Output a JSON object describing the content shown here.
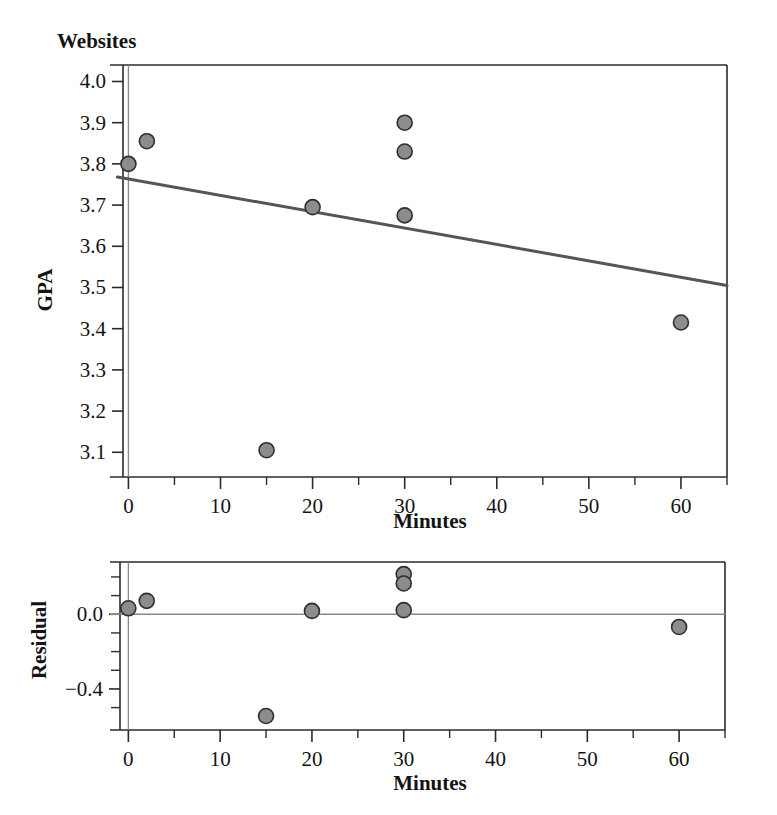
{
  "figure": {
    "title": "Websites",
    "background_color": "#ffffff",
    "point_fill_color": "#8c8c8c",
    "point_stroke_color": "#2e2e2e",
    "fit_line_color": "#555555",
    "axis_color": "#2b2b2b",
    "reference_line_color": "#8a8a8a"
  },
  "chart_data": [
    {
      "id": "scatter-gpa",
      "type": "scatter",
      "title": "Websites",
      "xlabel": "Minutes",
      "ylabel": "GPA",
      "xlim": [
        -2,
        65
      ],
      "ylim": [
        3.04,
        4.04
      ],
      "grid": false,
      "legend": null,
      "x_ticks": [
        0,
        10,
        20,
        30,
        40,
        50,
        60
      ],
      "x_tick_labels": [
        "0",
        "10",
        "20",
        "30",
        "40",
        "50",
        "60"
      ],
      "x_minor_step": 5,
      "y_ticks": [
        3.1,
        3.2,
        3.3,
        3.4,
        3.5,
        3.6,
        3.7,
        3.8,
        3.9,
        4.0
      ],
      "y_tick_labels": [
        "3.1",
        "3.2",
        "3.3",
        "3.4",
        "3.5",
        "3.6",
        "3.7",
        "3.8",
        "3.9",
        "4.0"
      ],
      "x": [
        0,
        2,
        15,
        20,
        30,
        30,
        30,
        60
      ],
      "y": [
        3.8,
        3.855,
        3.105,
        3.695,
        3.9,
        3.83,
        3.675,
        3.415
      ],
      "points": [
        {
          "x": 0,
          "y": 3.8
        },
        {
          "x": 2,
          "y": 3.855
        },
        {
          "x": 15,
          "y": 3.105
        },
        {
          "x": 20,
          "y": 3.695
        },
        {
          "x": 30,
          "y": 3.9
        },
        {
          "x": 30,
          "y": 3.83
        },
        {
          "x": 30,
          "y": 3.675
        },
        {
          "x": 60,
          "y": 3.415
        }
      ],
      "fit_line": {
        "type": "linear-regression",
        "x_start": -1.2,
        "y_start": 3.768,
        "x_end": 65,
        "y_end": 3.505
      },
      "vertical_reference_x": 0
    },
    {
      "id": "scatter-residual",
      "type": "scatter",
      "title": "",
      "xlabel": "Minutes",
      "ylabel": "Residual",
      "xlim": [
        -2,
        65
      ],
      "ylim": [
        -0.62,
        0.28
      ],
      "grid": false,
      "legend": null,
      "x_ticks": [
        0,
        10,
        20,
        30,
        40,
        50,
        60
      ],
      "x_tick_labels": [
        "0",
        "10",
        "20",
        "30",
        "40",
        "50",
        "60"
      ],
      "x_minor_step": 5,
      "y_ticks": [
        0.0,
        -0.4
      ],
      "y_tick_labels": [
        "0.0",
        "−0.4"
      ],
      "y_minor_ticks": [
        0.2,
        0.1,
        -0.1,
        -0.2,
        -0.3,
        -0.5
      ],
      "x": [
        0,
        2,
        15,
        20,
        30,
        30,
        30,
        60
      ],
      "y": [
        0.032,
        0.072,
        -0.545,
        0.018,
        0.215,
        0.165,
        0.022,
        -0.068
      ],
      "points": [
        {
          "x": 0,
          "y": 0.032
        },
        {
          "x": 2,
          "y": 0.072
        },
        {
          "x": 15,
          "y": -0.545
        },
        {
          "x": 20,
          "y": 0.018
        },
        {
          "x": 30,
          "y": 0.215
        },
        {
          "x": 30,
          "y": 0.165
        },
        {
          "x": 30,
          "y": 0.022
        },
        {
          "x": 60,
          "y": -0.068
        }
      ],
      "zero_reference_y": 0.0,
      "vertical_reference_x": 0
    }
  ]
}
